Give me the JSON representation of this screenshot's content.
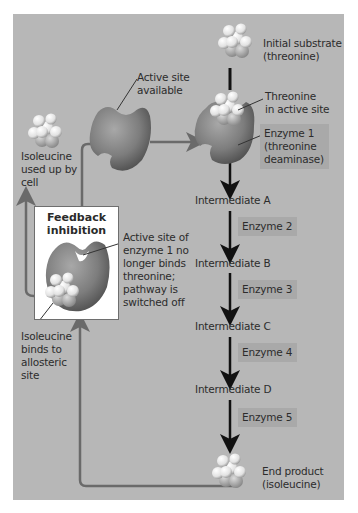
{
  "figure": {
    "type": "feedback-inhibition-pathway",
    "colors": {
      "panel_background": "#b7b7b7",
      "enzyme_label_box": "#a9a9a9",
      "main_arrow": "#111111",
      "feedback_line": "#6a6a6a",
      "enzyme_shape": "#7a7a7a",
      "feedback_box": "#ffffff"
    }
  },
  "labels": {
    "initial_substrate": "Initial substrate",
    "initial_substrate_name": "(threonine)",
    "threonine_active_line1": "Threonine",
    "threonine_active_line2": "in active site",
    "active_site_line1": "Active site",
    "active_site_line2": "available",
    "isoleucine_used_line1": "Isoleucine",
    "isoleucine_used_line2": "used up by",
    "isoleucine_used_line3": "cell",
    "feedback_title_line1": "Feedback",
    "feedback_title_line2": "inhibition",
    "inhibited_line1": "Active site of",
    "inhibited_line2": "enzyme 1 no",
    "inhibited_line3": "longer binds",
    "inhibited_line4": "threonine;",
    "inhibited_line5": "pathway is",
    "inhibited_line6": "switched off",
    "allosteric_line1": "Isoleucine",
    "allosteric_line2": "binds to",
    "allosteric_line3": "allosteric",
    "allosteric_line4": "site",
    "end_product_line1": "End product",
    "end_product_line2": "(isoleucine)"
  },
  "enzyme1": {
    "line1": "Enzyme 1",
    "line2": "(threonine",
    "line3": "deaminase)"
  },
  "pathway": {
    "intermediates": [
      "Intermediate A",
      "Intermediate B",
      "Intermediate C",
      "Intermediate D"
    ],
    "enzymes": [
      "Enzyme 2",
      "Enzyme 3",
      "Enzyme 4",
      "Enzyme 5"
    ]
  }
}
